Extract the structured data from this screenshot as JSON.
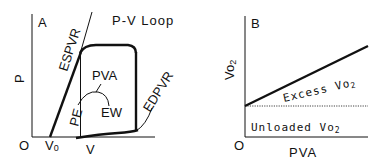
{
  "panel_a": {
    "label": "A",
    "y_axis_label": "P",
    "origin_label": "O",
    "v0_label": "V",
    "v0_sub": "0",
    "x_axis_label": "V",
    "espvr_label": "ESPVR",
    "loop_label": "P-V Loop",
    "pva_label": "PVA",
    "pe_label": "PE",
    "ew_label": "EW",
    "edpvr_label": "EDPVR"
  },
  "panel_b": {
    "label": "B",
    "y_axis_label": "Vo",
    "y_axis_sub": "2",
    "origin_label": "O",
    "x_axis_label": "PVA",
    "excess_label": "Excess Vo",
    "excess_sub": "2",
    "unloaded_label": "Unloaded Vo",
    "unloaded_sub": "2"
  },
  "colors": {
    "ink": "#111111",
    "background": "#ffffff"
  }
}
